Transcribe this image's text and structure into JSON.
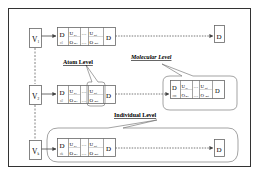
{
  "diagram": {
    "type": "hierarchy-levels",
    "colors": {
      "stroke": "#555555",
      "frame": "#333333",
      "text": "#222222",
      "background": "#ffffff"
    },
    "rows": [
      {
        "id": "row-1",
        "v_label": "V",
        "v_sub": "1",
        "block": {
          "d_first": "D",
          "d_first_sub": "o1",
          "u1": "U",
          "u1_sub": "n1",
          "o1": "O",
          "o1_sub": "m1",
          "ellipsis": "…",
          "un": "U",
          "un_sub": "nq",
          "on": "O",
          "on_sub": "mq",
          "d_last": "D"
        },
        "end_label": "D"
      },
      {
        "id": "row-2",
        "v_label": "V",
        "v_sub": "2",
        "block": {
          "d_first": "D",
          "d_first_sub": "o2",
          "u1": "U",
          "u1_sub": "n1",
          "o1": "O",
          "o1_sub": "m1",
          "ellipsis": "…",
          "un": "U",
          "un_sub": "nq",
          "on": "O",
          "on_sub": "mq",
          "d_last": "D"
        },
        "end_block": {
          "d_first": "D",
          "d_first_sub": "om",
          "u1": "U",
          "u1_sub": "n1",
          "o1": "O",
          "o1_sub": "m1",
          "ellipsis": "…",
          "un": "U",
          "un_sub": "nq",
          "on": "O",
          "on_sub": "mq",
          "d_last": "D"
        }
      },
      {
        "id": "row-3",
        "v_label": "V",
        "v_sub": "k",
        "block": {
          "d_first": "D",
          "d_first_sub": "ok",
          "u1": "U",
          "u1_sub": "n1",
          "o1": "O",
          "o1_sub": "m1",
          "ellipsis": "…",
          "un": "U",
          "un_sub": "nq",
          "on": "O",
          "on_sub": "mq",
          "d_last": "D"
        },
        "end_label": "D"
      }
    ],
    "callouts": {
      "atom": "Atom Level",
      "molecular": "Molecular Level",
      "individual": "Individual Level"
    }
  }
}
